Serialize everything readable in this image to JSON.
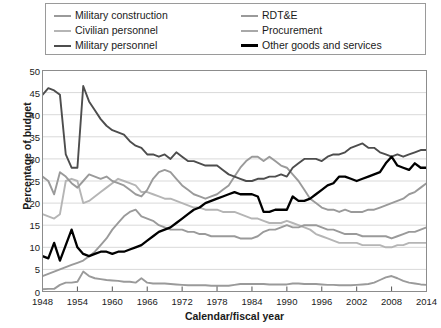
{
  "chart_data": {
    "type": "line",
    "title": "",
    "xlabel": "Calendar/fiscal year",
    "ylabel": "Percentage of budget",
    "xlim": [
      1948,
      2014
    ],
    "ylim": [
      0,
      50
    ],
    "ytick_labels": [
      "0",
      "5",
      "10",
      "15",
      "20",
      "25",
      "30",
      "35",
      "40",
      "45",
      "50"
    ],
    "ytick_values": [
      0,
      5,
      10,
      15,
      20,
      25,
      30,
      35,
      40,
      45,
      50
    ],
    "xtick_labels": [
      "1948",
      "1954",
      "1960",
      "1966",
      "1972",
      "1978",
      "1984",
      "1990",
      "1996",
      "2002",
      "2008",
      "2014"
    ],
    "xtick_values": [
      1948,
      1954,
      1960,
      1966,
      1972,
      1978,
      1984,
      1990,
      1996,
      2002,
      2008,
      2014
    ],
    "grid": "horizontal",
    "legend_position": "top",
    "x": [
      1948,
      1949,
      1950,
      1951,
      1952,
      1953,
      1954,
      1955,
      1956,
      1957,
      1958,
      1959,
      1960,
      1961,
      1962,
      1963,
      1964,
      1965,
      1966,
      1967,
      1968,
      1969,
      1970,
      1971,
      1972,
      1973,
      1974,
      1975,
      1976,
      1977,
      1978,
      1979,
      1980,
      1981,
      1982,
      1983,
      1984,
      1985,
      1986,
      1987,
      1988,
      1989,
      1990,
      1991,
      1992,
      1993,
      1994,
      1995,
      1996,
      1997,
      1998,
      1999,
      2000,
      2001,
      2002,
      2003,
      2004,
      2005,
      2006,
      2007,
      2008,
      2009,
      2010,
      2011,
      2012,
      2013,
      2014
    ],
    "series": [
      {
        "name": "Military personnel",
        "color": "#4d4d4d",
        "width": 1.9,
        "values": [
          44.5,
          46.0,
          45.5,
          44.5,
          31.0,
          28.0,
          28.0,
          46.5,
          43.0,
          41.0,
          39.0,
          37.5,
          36.5,
          36.0,
          35.5,
          34.0,
          33.0,
          32.5,
          31.0,
          31.0,
          30.5,
          31.0,
          30.0,
          31.5,
          30.5,
          29.5,
          29.5,
          29.0,
          28.5,
          28.5,
          28.5,
          27.5,
          26.5,
          26.0,
          25.5,
          25.0,
          25.0,
          25.5,
          25.5,
          26.0,
          26.0,
          26.5,
          26.0,
          28.0,
          29.0,
          30.0,
          30.0,
          30.0,
          29.5,
          30.5,
          31.0,
          31.0,
          31.5,
          32.5,
          33.0,
          33.5,
          32.5,
          32.5,
          31.5,
          31.0,
          30.5,
          31.0,
          30.5,
          31.0,
          31.5,
          32.0,
          32.0
        ]
      },
      {
        "name": "RDT&E",
        "color": "#9a9a9a",
        "width": 1.9,
        "values": [
          3.5,
          4.0,
          4.5,
          5.0,
          5.5,
          6.0,
          6.5,
          7.0,
          8.0,
          9.0,
          10.5,
          12.0,
          14.0,
          15.5,
          17.0,
          18.0,
          18.5,
          17.0,
          16.5,
          16.0,
          15.0,
          14.5,
          14.0,
          14.0,
          14.0,
          13.5,
          13.5,
          13.0,
          13.0,
          12.5,
          12.5,
          12.5,
          12.5,
          12.5,
          12.0,
          12.0,
          12.0,
          12.5,
          13.5,
          14.0,
          14.0,
          14.5,
          15.0,
          14.5,
          14.5,
          15.0,
          15.0,
          15.0,
          14.5,
          14.0,
          14.0,
          13.5,
          13.0,
          13.0,
          13.0,
          12.5,
          12.5,
          12.5,
          12.5,
          12.5,
          12.0,
          12.5,
          13.0,
          13.5,
          13.5,
          14.0,
          14.5
        ]
      },
      {
        "name": "Procurement",
        "color": "#9a9a9a",
        "width": 1.9,
        "values": [
          26.0,
          25.0,
          22.0,
          27.0,
          26.0,
          24.5,
          23.5,
          25.0,
          26.5,
          26.0,
          25.5,
          26.0,
          25.0,
          24.5,
          24.0,
          23.0,
          22.0,
          21.5,
          23.0,
          25.5,
          27.0,
          27.5,
          27.0,
          25.5,
          24.0,
          23.0,
          22.0,
          21.5,
          21.0,
          21.5,
          22.0,
          23.0,
          24.0,
          26.0,
          28.0,
          29.5,
          30.5,
          30.5,
          29.5,
          30.5,
          29.5,
          28.5,
          28.0,
          26.5,
          25.0,
          23.0,
          21.0,
          20.0,
          19.0,
          18.5,
          18.5,
          18.0,
          18.5,
          18.0,
          18.0,
          18.0,
          18.5,
          18.5,
          19.0,
          19.5,
          20.0,
          20.5,
          21.0,
          22.0,
          22.5,
          23.5,
          24.5
        ]
      },
      {
        "name": "Civilian personnel",
        "color": "#b5b5b5",
        "width": 1.9,
        "values": [
          17.5,
          17.0,
          16.5,
          17.5,
          25.0,
          25.5,
          25.0,
          20.0,
          20.5,
          21.5,
          22.5,
          23.5,
          24.5,
          25.5,
          25.0,
          24.5,
          24.0,
          22.5,
          22.5,
          22.0,
          21.5,
          21.0,
          21.0,
          20.5,
          20.0,
          19.5,
          19.0,
          19.0,
          18.5,
          18.5,
          18.5,
          18.0,
          18.0,
          18.0,
          17.5,
          17.0,
          16.5,
          16.5,
          16.0,
          15.5,
          15.5,
          15.5,
          16.0,
          15.5,
          15.0,
          14.5,
          14.0,
          13.0,
          12.5,
          12.0,
          11.5,
          11.0,
          11.0,
          11.0,
          11.0,
          10.5,
          10.5,
          10.5,
          10.5,
          10.0,
          10.0,
          10.5,
          10.5,
          11.0,
          11.0,
          11.0,
          11.0
        ]
      },
      {
        "name": "Other goods and services",
        "color": "#000000",
        "width": 2.3,
        "values": [
          8.0,
          7.5,
          11.0,
          7.0,
          10.5,
          14.0,
          10.0,
          8.5,
          8.0,
          8.5,
          9.0,
          9.0,
          8.5,
          9.0,
          9.0,
          9.5,
          10.0,
          10.5,
          11.5,
          12.5,
          13.5,
          14.0,
          14.5,
          15.5,
          16.5,
          17.5,
          18.5,
          19.0,
          20.0,
          20.5,
          21.0,
          21.5,
          22.0,
          22.5,
          22.0,
          22.0,
          22.0,
          21.5,
          18.0,
          18.0,
          18.5,
          18.5,
          18.5,
          21.5,
          20.5,
          20.5,
          21.0,
          22.0,
          23.0,
          24.0,
          24.5,
          26.0,
          26.0,
          25.5,
          25.0,
          25.5,
          26.0,
          26.5,
          27.0,
          29.0,
          30.5,
          28.5,
          28.0,
          27.5,
          29.0,
          28.0,
          28.0
        ]
      },
      {
        "name": "Military construction",
        "color": "#9a9a9a",
        "width": 1.9,
        "values": [
          0.5,
          0.6,
          0.6,
          1.5,
          2.0,
          2.0,
          2.2,
          4.5,
          3.5,
          3.0,
          2.8,
          2.6,
          2.5,
          2.4,
          2.2,
          2.2,
          2.0,
          3.0,
          2.0,
          1.8,
          1.8,
          1.8,
          1.7,
          1.6,
          1.5,
          1.4,
          1.4,
          1.4,
          1.4,
          1.3,
          1.3,
          1.3,
          1.3,
          1.5,
          1.7,
          1.7,
          1.7,
          1.7,
          1.7,
          1.6,
          1.6,
          1.6,
          1.6,
          1.8,
          1.8,
          1.7,
          1.7,
          1.7,
          1.6,
          1.5,
          1.5,
          1.4,
          1.4,
          1.4,
          1.5,
          1.6,
          1.7,
          2.0,
          2.6,
          3.2,
          3.5,
          3.0,
          2.4,
          2.0,
          1.8,
          1.6,
          1.5
        ]
      }
    ]
  },
  "legend": {
    "left_items": [
      {
        "label": "Military construction",
        "color": "#9a9a9a",
        "width": 2
      },
      {
        "label": "Civilian personnel",
        "color": "#b5b5b5",
        "width": 2
      },
      {
        "label": "Military personnel",
        "color": "#4d4d4d",
        "width": 2.5
      }
    ],
    "right_items": [
      {
        "label": "RDT&E",
        "color": "#9a9a9a",
        "width": 2
      },
      {
        "label": "Procurement",
        "color": "#a8a8a8",
        "width": 2
      },
      {
        "label": "Other goods and services",
        "color": "#000000",
        "width": 3
      }
    ]
  },
  "axes": {
    "ylabel": "Percentage of budget",
    "xlabel": "Calendar/fiscal year"
  }
}
